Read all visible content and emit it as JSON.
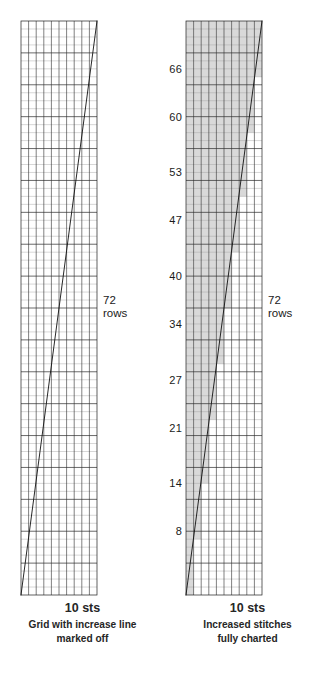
{
  "figure": {
    "background_color": "#ffffff"
  },
  "style": {
    "grid_minor_color": "#9a9a9a",
    "grid_major_color": "#2b2b2b",
    "grid_border_color": "#1f1f1f",
    "increase_line_color": "#111111",
    "shade_fill_color": "#d9d9d9",
    "text_color": "#1a1a1a"
  },
  "chart_data": {
    "type": "line",
    "title": "Grid with increase line marked off",
    "xlabel": "10 sts",
    "ylabel": "72 rows",
    "columns": 10,
    "rows": 72,
    "xlim": [
      0,
      10
    ],
    "ylim": [
      0,
      72
    ],
    "grid": true,
    "grid_major_every_x": 1,
    "grid_major_every_y": 4,
    "legend": "none",
    "series": [
      {
        "name": "increase line",
        "x": [
          0,
          10
        ],
        "y": [
          0,
          72
        ]
      }
    ],
    "annotations": [
      {
        "text": "72 rows",
        "x": 10,
        "y": 36
      }
    ]
  },
  "panels": [
    {
      "id": "grid-with-increase-line",
      "caption_sts": "10 sts",
      "caption_desc_line1": "Grid with increase line",
      "caption_desc_line2": "marked off",
      "rows_note_number": "72",
      "rows_note_unit": "rows",
      "shaded": false,
      "tick_labels": []
    },
    {
      "id": "increased-stitches-fully-charted",
      "caption_sts": "10 sts",
      "caption_desc_line1": "Increased stitches",
      "caption_desc_line2": "fully charted",
      "rows_note_number": "72",
      "rows_note_unit": "rows",
      "shaded": true,
      "tick_labels": [
        {
          "value": "8",
          "row": 8
        },
        {
          "value": "14",
          "row": 14
        },
        {
          "value": "21",
          "row": 21
        },
        {
          "value": "27",
          "row": 27
        },
        {
          "value": "34",
          "row": 34
        },
        {
          "value": "40",
          "row": 40
        },
        {
          "value": "47",
          "row": 47
        },
        {
          "value": "53",
          "row": 53
        },
        {
          "value": "60",
          "row": 60
        },
        {
          "value": "66",
          "row": 66
        }
      ]
    }
  ]
}
